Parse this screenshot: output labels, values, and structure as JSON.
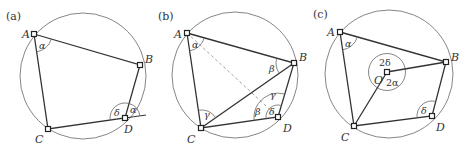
{
  "figure": {
    "panels": [
      {
        "label": "(a)",
        "circle": {
          "cx": 83,
          "cy": 76,
          "r": 63
        },
        "vertices": {
          "A": [
            34,
            34
          ],
          "B": [
            140,
            65
          ],
          "D": [
            125,
            118
          ],
          "C": [
            48,
            129
          ]
        },
        "point_labels": {
          "A": "A",
          "B": "B",
          "C": "C",
          "D": "D"
        },
        "angles": {
          "at_A": "α",
          "at_D_interior": "δ",
          "at_D_exterior": "α"
        }
      },
      {
        "label": "(b)",
        "circle": {
          "cx": 235,
          "cy": 75,
          "r": 63
        },
        "vertices": {
          "A": [
            187,
            33
          ],
          "B": [
            294,
            63
          ],
          "D": [
            278,
            117
          ],
          "C": [
            201,
            128
          ]
        },
        "point_labels": {
          "A": "A",
          "B": "B",
          "C": "C",
          "D": "D"
        },
        "angles": {
          "at_A": "α",
          "at_B": "β",
          "at_C": "γ",
          "at_D_beta": "β",
          "at_D_gamma": "γ",
          "at_D_delta": "δ"
        },
        "dashed_line": "A–D"
      },
      {
        "label": "(c)",
        "circle": {
          "cx": 389,
          "cy": 74,
          "r": 64
        },
        "vertices": {
          "A": [
            340,
            32
          ],
          "B": [
            446,
            62
          ],
          "D": [
            432,
            116
          ],
          "C": [
            354,
            126
          ],
          "O": [
            387,
            72
          ]
        },
        "point_labels": {
          "A": "A",
          "B": "B",
          "C": "C",
          "D": "D",
          "O": "O"
        },
        "angles": {
          "at_A": "α",
          "at_D": "δ",
          "at_O_upper": "2δ",
          "at_O_lower": "2α"
        }
      }
    ]
  }
}
